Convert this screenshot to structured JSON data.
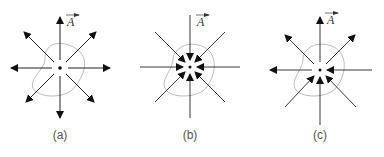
{
  "figure": {
    "panels": [
      {
        "id": "a",
        "caption": "(a)",
        "vector_label": "A",
        "description": "field lines diverging outward from point source (positive divergence)"
      },
      {
        "id": "b",
        "caption": "(b)",
        "vector_label": "A",
        "description": "field lines converging inward to point sink (negative divergence)"
      },
      {
        "id": "c",
        "caption": "(c)",
        "vector_label": "A",
        "description": "field lines passing through point, some in and some out (zero divergence)"
      }
    ]
  }
}
